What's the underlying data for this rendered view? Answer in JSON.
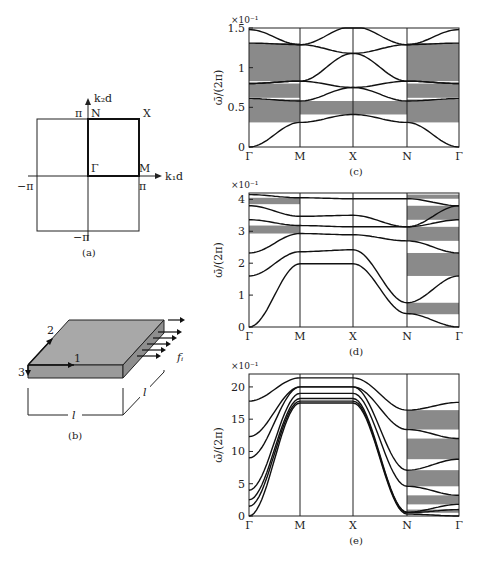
{
  "panel_a": {
    "caption": "(a)",
    "axis_x_label": "k₁d",
    "axis_y_label": "k₂d",
    "ticks": {
      "x_pos": "π",
      "x_neg": "−π",
      "y_pos": "π",
      "y_neg": "−π"
    },
    "points": {
      "gamma": "Γ",
      "m": "M",
      "x": "X",
      "n": "N"
    }
  },
  "panel_b": {
    "caption": "(b)",
    "axis_labels": {
      "one": "1",
      "two": "2",
      "three": "3"
    },
    "length_label_front": "l",
    "length_label_side": "l",
    "force_label": "fᵢ"
  },
  "chart_data": [
    {
      "id": "c",
      "type": "line",
      "caption": "(c)",
      "ylabel": "ω̄/(2π)",
      "y_multiplier": "×10⁻¹",
      "xticks": [
        "Γ",
        "M",
        "X",
        "N",
        "Γ"
      ],
      "yticks": [
        "0",
        "0.5",
        "1",
        "1.5"
      ],
      "ylim": [
        0,
        1.5
      ],
      "band_gaps_shaded": [
        {
          "segment": "Γ-M",
          "ranges": [
            [
              0.31,
              0.6
            ],
            [
              0.62,
              0.8
            ],
            [
              0.83,
              1.31
            ]
          ]
        },
        {
          "segment": "M-X-N",
          "ranges": [
            [
              0.41,
              0.58
            ]
          ]
        },
        {
          "segment": "N-Γ",
          "ranges": [
            [
              0.31,
              0.6
            ],
            [
              0.62,
              0.8
            ],
            [
              0.83,
              1.31
            ]
          ]
        }
      ],
      "series": [
        {
          "name": "branch-1",
          "values": [
            0.0,
            0.31,
            0.41,
            0.31,
            0.0
          ]
        },
        {
          "name": "branch-2",
          "values": [
            0.61,
            0.58,
            0.75,
            0.58,
            0.61
          ]
        },
        {
          "name": "branch-3",
          "values": [
            0.8,
            0.83,
            0.75,
            0.83,
            0.8
          ]
        },
        {
          "name": "branch-4",
          "values": [
            0.8,
            0.83,
            1.18,
            0.83,
            0.8
          ]
        },
        {
          "name": "branch-5",
          "values": [
            1.31,
            1.29,
            1.18,
            1.29,
            1.31
          ]
        },
        {
          "name": "branch-6",
          "values": [
            1.48,
            1.29,
            1.52,
            1.29,
            1.48
          ]
        }
      ]
    },
    {
      "id": "d",
      "type": "line",
      "caption": "(d)",
      "ylabel": "ω̄/(2π)",
      "y_multiplier": "×10⁻¹",
      "xticks": [
        "Γ",
        "M",
        "X",
        "N",
        "Γ"
      ],
      "yticks": [
        "0",
        "1",
        "2",
        "3",
        "4"
      ],
      "ylim": [
        0,
        4.2
      ],
      "band_gaps_shaded": [
        {
          "segment": "Γ-M",
          "ranges": [
            [
              2.93,
              3.18
            ],
            [
              3.85,
              4.05
            ]
          ]
        },
        {
          "segment": "N-Γ",
          "ranges": [
            [
              0.4,
              0.76
            ],
            [
              1.6,
              2.32
            ],
            [
              2.7,
              3.14
            ],
            [
              3.36,
              3.8
            ],
            [
              4.02,
              4.15
            ]
          ]
        }
      ],
      "series": [
        {
          "name": "branch-1",
          "values": [
            0.0,
            1.98,
            1.98,
            0.42,
            0.0
          ]
        },
        {
          "name": "branch-2",
          "values": [
            1.6,
            2.36,
            2.42,
            0.76,
            1.6
          ]
        },
        {
          "name": "branch-3",
          "values": [
            2.32,
            2.93,
            2.89,
            2.7,
            2.32
          ]
        },
        {
          "name": "branch-4",
          "values": [
            3.36,
            3.18,
            3.14,
            3.14,
            3.36
          ]
        },
        {
          "name": "branch-5",
          "values": [
            3.8,
            3.47,
            3.5,
            3.14,
            3.8
          ]
        },
        {
          "name": "branch-6",
          "values": [
            4.15,
            4.05,
            4.02,
            4.02,
            3.8
          ]
        }
      ]
    },
    {
      "id": "e",
      "type": "line",
      "caption": "(e)",
      "ylabel": "ω̄/(2π)",
      "y_multiplier": "×10⁻¹",
      "xticks": [
        "Γ",
        "M",
        "X",
        "N",
        "Γ"
      ],
      "yticks": [
        "0",
        "5",
        "10",
        "15",
        "20"
      ],
      "ylim": [
        0,
        22
      ],
      "band_gaps_shaded": [
        {
          "segment": "N-Γ",
          "ranges": [
            [
              0.5,
              1.0
            ],
            [
              1.8,
              3.2
            ],
            [
              4.6,
              7.1
            ],
            [
              8.8,
              12.0
            ],
            [
              13.4,
              16.4
            ]
          ]
        }
      ],
      "series": [
        {
          "name": "branch-1",
          "values": [
            0.0,
            17.5,
            17.5,
            0.3,
            0.0
          ]
        },
        {
          "name": "branch-2",
          "values": [
            1.5,
            17.8,
            17.8,
            0.5,
            1.0
          ]
        },
        {
          "name": "branch-3",
          "values": [
            2.5,
            18.2,
            18.2,
            0.6,
            1.8
          ]
        },
        {
          "name": "branch-4",
          "values": [
            4.0,
            19.0,
            19.0,
            4.6,
            3.2
          ]
        },
        {
          "name": "branch-5",
          "values": [
            9.0,
            20.0,
            20.0,
            7.1,
            8.8
          ]
        },
        {
          "name": "branch-6",
          "values": [
            12.3,
            20.0,
            20.0,
            13.4,
            12.0
          ]
        },
        {
          "name": "branch-7",
          "values": [
            17.8,
            21.4,
            21.4,
            16.4,
            17.6
          ]
        }
      ]
    }
  ]
}
